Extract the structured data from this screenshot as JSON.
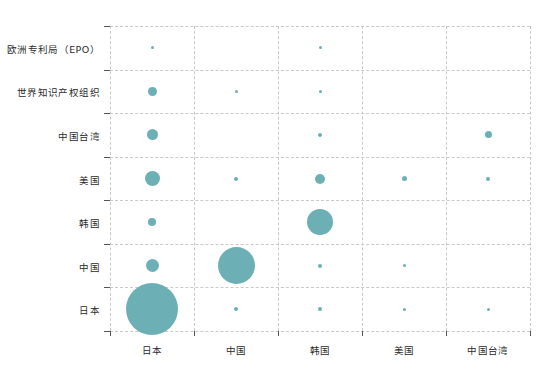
{
  "chart_data": {
    "type": "scatter",
    "title": "",
    "subtitle": "",
    "xlabel": "",
    "ylabel": "",
    "grid": true,
    "legend": null,
    "bubble_color": "#5fa9b0",
    "grid_color": "#c9c9c9",
    "axis_color": "#555555",
    "categories_x": [
      "日本",
      "中国",
      "韩国",
      "美国",
      "中国台湾"
    ],
    "categories_y": [
      "日本",
      "中国",
      "韩国",
      "美国",
      "中国台湾",
      "世界知识产权组织",
      "欧洲专利局（EPO）"
    ],
    "x_tick_labels": [
      "日本",
      "中国",
      "韩国",
      "美国",
      "中国台湾"
    ],
    "y_tick_labels": [
      "欧洲专利局（EPO）",
      "世界知识产权组织",
      "中国台湾",
      "美国",
      "韩国",
      "中国",
      "日本"
    ],
    "size_encoding": "bubble area proportional to count",
    "points": [
      {
        "x": "日本",
        "y": "日本",
        "size": 52
      },
      {
        "x": "中国",
        "y": "日本",
        "size": 4
      },
      {
        "x": "韩国",
        "y": "日本",
        "size": 4
      },
      {
        "x": "美国",
        "y": "日本",
        "size": 3
      },
      {
        "x": "中国台湾",
        "y": "日本",
        "size": 3
      },
      {
        "x": "日本",
        "y": "中国",
        "size": 13
      },
      {
        "x": "中国",
        "y": "中国",
        "size": 37
      },
      {
        "x": "韩国",
        "y": "中国",
        "size": 4
      },
      {
        "x": "美国",
        "y": "中国",
        "size": 3
      },
      {
        "x": "日本",
        "y": "韩国",
        "size": 8
      },
      {
        "x": "韩国",
        "y": "韩国",
        "size": 26
      },
      {
        "x": "日本",
        "y": "美国",
        "size": 15
      },
      {
        "x": "中国",
        "y": "美国",
        "size": 4
      },
      {
        "x": "韩国",
        "y": "美国",
        "size": 10
      },
      {
        "x": "美国",
        "y": "美国",
        "size": 5
      },
      {
        "x": "中国台湾",
        "y": "美国",
        "size": 4
      },
      {
        "x": "日本",
        "y": "中国台湾",
        "size": 11
      },
      {
        "x": "韩国",
        "y": "中国台湾",
        "size": 4
      },
      {
        "x": "中国台湾",
        "y": "中国台湾",
        "size": 7
      },
      {
        "x": "日本",
        "y": "世界知识产权组织",
        "size": 9
      },
      {
        "x": "中国",
        "y": "世界知识产权组织",
        "size": 3
      },
      {
        "x": "韩国",
        "y": "世界知识产权组织",
        "size": 3
      },
      {
        "x": "日本",
        "y": "欧洲专利局（EPO）",
        "size": 3
      },
      {
        "x": "韩国",
        "y": "欧洲专利局（EPO）",
        "size": 3
      }
    ]
  }
}
